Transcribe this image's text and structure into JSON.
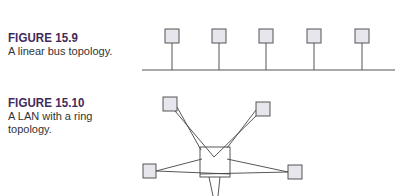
{
  "figures": [
    {
      "label": "FIGURE 15.9",
      "caption": "A linear bus topology."
    },
    {
      "label": "FIGURE 15.10",
      "caption": "A LAN with a ring topology."
    }
  ],
  "colors": {
    "label": "#3f2a5a",
    "caption": "#333333",
    "node_fill": "#e6e6ec",
    "node_stroke": "#555555",
    "line": "#444444"
  }
}
